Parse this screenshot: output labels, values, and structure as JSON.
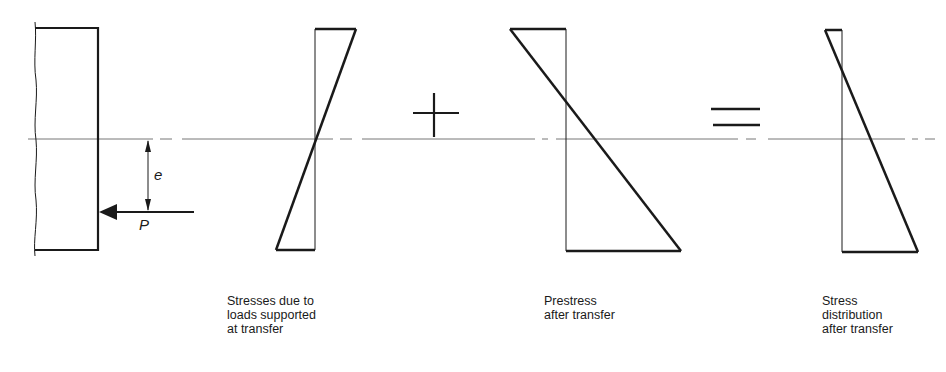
{
  "figure": {
    "section": {
      "label_eccentricity": "e",
      "label_force": "P"
    },
    "operators": {
      "plus": "+",
      "equals": "="
    },
    "diagrams": [
      {
        "id": "loads-at-transfer",
        "caption": [
          "Stresses due to",
          "loads supported",
          "at transfer"
        ]
      },
      {
        "id": "prestress-after-transfer",
        "caption": [
          "Prestress",
          "after transfer"
        ]
      },
      {
        "id": "stress-distribution",
        "caption": [
          "Stress",
          "distribution",
          "after transfer"
        ]
      }
    ],
    "colors": {
      "ink": "#1a1a1a",
      "background": "#ffffff",
      "centroid_line": "#666666"
    }
  }
}
